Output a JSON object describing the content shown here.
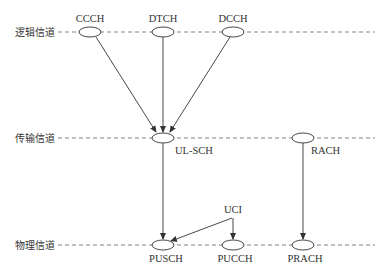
{
  "layers": [
    {
      "label": "逻辑信道",
      "y": 32
    },
    {
      "label": "传输信道",
      "y": 138
    },
    {
      "label": "物理信道",
      "y": 245
    }
  ],
  "nodes": {
    "ccch": {
      "label": "CCCH",
      "x": 90,
      "y": 32
    },
    "dtch": {
      "label": "DTCH",
      "x": 163,
      "y": 32
    },
    "dcch": {
      "label": "DCCH",
      "x": 233,
      "y": 32
    },
    "ulsch": {
      "label": "UL-SCH",
      "x": 163,
      "y": 138
    },
    "rach": {
      "label": "RACH",
      "x": 303,
      "y": 138
    },
    "pusch": {
      "label": "PUSCH",
      "x": 163,
      "y": 245
    },
    "pucch": {
      "label": "PUCCH",
      "x": 233,
      "y": 245
    },
    "prach": {
      "label": "PRACH",
      "x": 303,
      "y": 245
    },
    "uci": {
      "label": "UCI",
      "x": 233,
      "y": 208
    }
  },
  "edges": [
    [
      "CCCH",
      "UL-SCH"
    ],
    [
      "DTCH",
      "UL-SCH"
    ],
    [
      "DCCH",
      "UL-SCH"
    ],
    [
      "UL-SCH",
      "PUSCH"
    ],
    [
      "RACH",
      "PRACH"
    ],
    [
      "UCI",
      "PUSCH"
    ],
    [
      "UCI",
      "PUCCH"
    ]
  ]
}
